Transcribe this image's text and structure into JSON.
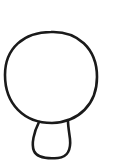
{
  "sketch": {
    "background": "#ffffff",
    "stroke_color": "#1a1a1a",
    "stroke_width": 2.6,
    "shapes": [
      {
        "name": "head-circle",
        "type": "closed-curve",
        "path": "M 51 32 C 77 31, 97 48, 97 77 C 97 104, 79 122, 52 123 C 24 123, 5 104, 5 75 C 5 48, 24 32, 51 32 Z"
      },
      {
        "name": "stem-loop",
        "type": "open-curve",
        "path": "M 39 122 C 34 132, 31 144, 34 151 C 37 158, 46 159, 58 158 C 68 157, 71 149, 70 139 C 69 131, 68 126, 68 121"
      }
    ]
  }
}
